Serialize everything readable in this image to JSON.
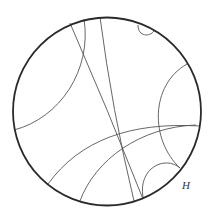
{
  "diagram": {
    "type": "poincare-disk-geodesics",
    "boundary": {
      "cx": 107,
      "cy": 111.5,
      "r": 94,
      "stroke": "#2a2a2a",
      "stroke_width": 1.8
    },
    "line_color": "#555555",
    "label": {
      "text": "H",
      "x": 182,
      "y": 189
    }
  }
}
